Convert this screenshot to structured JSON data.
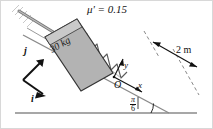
{
  "figure": {
    "friction_label": {
      "symbol": "μ'",
      "equals": " = ",
      "value": "0.15",
      "full": "μ' = 0.15"
    },
    "block": {
      "mass_label": "30 kg",
      "fill_color": "#b3b3b3",
      "stroke_color": "#333333"
    },
    "spring": {
      "coils": 8,
      "stroke_color": "#555555"
    },
    "incline": {
      "angle_numerator": "π",
      "angle_denominator": "6",
      "angle_label": "π/6",
      "surface_color": "#8a8a8a"
    },
    "distance": {
      "label": "2 m",
      "arrow_style": "double-headed",
      "guide_style": "dashed"
    },
    "origin_label": "O",
    "axes": {
      "x_label": "x",
      "y_label": "y"
    },
    "unit_vectors": {
      "i_label": "i",
      "j_label": "j"
    },
    "ground": {
      "color": "#8a8a8a"
    },
    "wall": {
      "hatch_color": "#c9c9c9"
    },
    "background_color": "#ffffff",
    "border_color": "#d8d8d8"
  }
}
